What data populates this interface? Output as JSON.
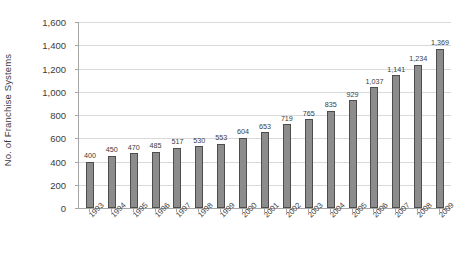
{
  "chart_data": {
    "type": "bar",
    "title": "",
    "xlabel": "",
    "ylabel": "No. of Franchise Systems",
    "ylim": [
      0,
      1600
    ],
    "ytick_step": 200,
    "grid": true,
    "legend": false,
    "categories": [
      "1993",
      "1994",
      "1995",
      "1996",
      "1997",
      "1998",
      "1999",
      "2000",
      "2001",
      "2002",
      "2003",
      "2004",
      "2005",
      "2006",
      "2007",
      "2008",
      "2009"
    ],
    "values": [
      400,
      450,
      470,
      485,
      517,
      530,
      553,
      604,
      653,
      719,
      765,
      835,
      929,
      1037,
      1141,
      1234,
      1369
    ],
    "value_labels": [
      "400",
      "450",
      "470",
      "485",
      "517",
      "530",
      "553",
      "604",
      "653",
      "719",
      "765",
      "835",
      "929",
      "1,037",
      "1,141",
      "1,234",
      "1,369"
    ],
    "ytick_labels": [
      "0",
      "200",
      "400",
      "600",
      "800",
      "1,000",
      "1,200",
      "1,400",
      "1,600"
    ],
    "ytick_values": [
      0,
      200,
      400,
      600,
      800,
      1000,
      1200,
      1400,
      1600
    ],
    "colors": {
      "bar_fill": "#8c8c8c",
      "bar_stroke": "#4d4d4d",
      "gridline": "#d9d9d9",
      "axis": "#a6a6a6",
      "text": "#3b3b3b",
      "background": "#ffffff"
    }
  }
}
